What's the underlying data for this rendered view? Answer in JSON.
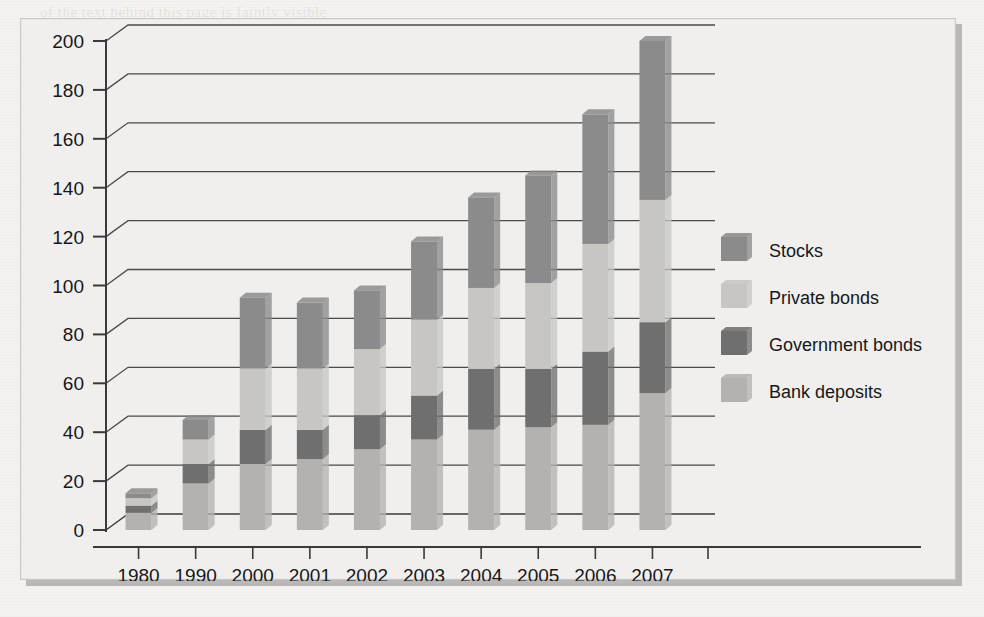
{
  "chart_data": {
    "type": "bar",
    "stacked": true,
    "title": "",
    "xlabel": "",
    "ylabel": "",
    "ylim": [
      0,
      200
    ],
    "ytick_step": 20,
    "yticks": [
      0,
      20,
      40,
      60,
      80,
      100,
      120,
      140,
      160,
      180,
      200
    ],
    "grid": true,
    "legend_position": "right",
    "categories": [
      "1980",
      "1990",
      "2000",
      "2001",
      "2002",
      "2003",
      "2004",
      "2005",
      "2006",
      "2007"
    ],
    "series": [
      {
        "name": "Bank deposits",
        "color": "#b3b2b0",
        "values": [
          7,
          19,
          27,
          29,
          33,
          37,
          41,
          42,
          43,
          56
        ]
      },
      {
        "name": "Government bonds",
        "color": "#6f6f70",
        "values": [
          3,
          8,
          14,
          12,
          14,
          18,
          25,
          24,
          30,
          29
        ]
      },
      {
        "name": "Private bonds",
        "color": "#c7c6c3",
        "values": [
          3,
          10,
          25,
          25,
          27,
          31,
          33,
          35,
          44,
          50
        ]
      },
      {
        "name": "Stocks",
        "color": "#8b8b8c",
        "values": [
          2,
          8,
          29,
          27,
          24,
          32,
          37,
          44,
          53,
          65
        ]
      }
    ],
    "totals": [
      15,
      45,
      95,
      93,
      98,
      118,
      136,
      145,
      170,
      200
    ]
  },
  "legend": {
    "items": [
      {
        "label": "Stocks",
        "swatch": "#8b8b8c"
      },
      {
        "label": "Private bonds",
        "swatch": "#c7c6c3"
      },
      {
        "label": "Government bonds",
        "swatch": "#6f6f70"
      },
      {
        "label": "Bank deposits",
        "swatch": "#b3b2b0"
      }
    ]
  },
  "colors": {
    "page_background": "#f3f2f0",
    "frame_background": "#f0efed",
    "frame_shadow": "#b9b8b6",
    "axis_line": "#3a3a3c",
    "grid_line": "#4a4a4c",
    "text": "#17171a"
  },
  "background_text": {
    "lines": [
      "of the text behind this page is faintly visible",
      "through the paper of the scanned sheet here",
      "and below and above and below this line",
      "continues across the printed page margin",
      "a second paragraph of reversed characters",
      "that cannot be read clearly at this scale"
    ]
  }
}
